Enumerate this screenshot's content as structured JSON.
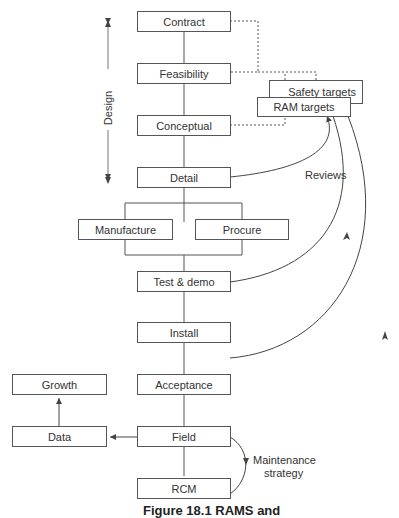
{
  "diagram": {
    "main_flow": [
      {
        "id": "contract",
        "label": "Contract"
      },
      {
        "id": "feasibility",
        "label": "Feasibility"
      },
      {
        "id": "conceptual",
        "label": "Conceptual"
      },
      {
        "id": "detail",
        "label": "Detail"
      },
      {
        "id": "manufacture",
        "label": "Manufacture"
      },
      {
        "id": "procure",
        "label": "Procure"
      },
      {
        "id": "test_demo",
        "label": "Test & demo"
      },
      {
        "id": "install",
        "label": "Install"
      },
      {
        "id": "acceptance",
        "label": "Acceptance"
      },
      {
        "id": "field",
        "label": "Field"
      },
      {
        "id": "rcm",
        "label": "RCM"
      }
    ],
    "side": {
      "growth": "Growth",
      "data": "Data",
      "safety_targets": "Safety targets",
      "ram_targets": "RAM targets"
    },
    "annotations": {
      "design": "Design",
      "reviews": "Reviews",
      "maintenance_line1": "Maintenance",
      "maintenance_line2": "strategy"
    },
    "caption": "Figure 18.1 RAMS and"
  }
}
